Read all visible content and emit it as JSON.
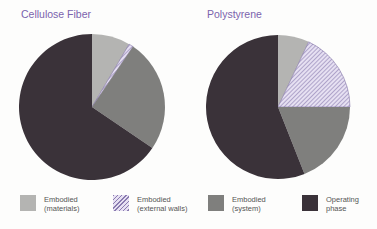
{
  "chart_data": [
    {
      "type": "pie",
      "title": "Cellulose Fiber",
      "categories": [
        "Embodied (materials)",
        "Embodied (external walls)",
        "Embodied (system)",
        "Operating phase"
      ],
      "values": [
        8.5,
        1,
        25,
        65.5
      ],
      "unit": "%"
    },
    {
      "type": "pie",
      "title": "Polystyrene",
      "categories": [
        "Embodied (materials)",
        "Embodied (external walls)",
        "Embodied (system)",
        "Operating phase"
      ],
      "values": [
        7,
        18,
        19,
        56
      ],
      "unit": "%"
    }
  ],
  "legend": {
    "position": "bottom",
    "items": [
      {
        "line1": "Embodied",
        "line2": "(materials)",
        "color": "#b4b4b2"
      },
      {
        "line1": "Embodied",
        "line2": "(external walls)",
        "color": "hatch-lavender"
      },
      {
        "line1": "Embodied",
        "line2": "(system)",
        "color": "#7f7f7d"
      },
      {
        "line1": "Operating",
        "line2": "phase",
        "color": "#3a3239"
      }
    ]
  },
  "colors": {
    "title": "#7b63ad",
    "materials": "#b4b4b2",
    "external_walls_bg": "#e6e0f2",
    "external_walls_hatch": "#8a7bb0",
    "system": "#7f7f7d",
    "operating": "#3a3239"
  }
}
